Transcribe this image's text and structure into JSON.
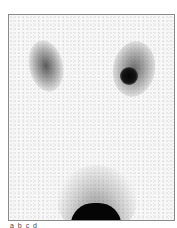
{
  "image": {
    "description": "Grayscale nuclear medicine renal scintigraphy scan, posterior view",
    "background": "#f7f7f7",
    "frame_border": "#8a8a8a",
    "structures": [
      {
        "name": "left-kidney",
        "intensity": "moderate"
      },
      {
        "name": "right-kidney",
        "intensity": "moderate with focal hot spot"
      },
      {
        "name": "bladder",
        "intensity": "high"
      }
    ]
  },
  "caption": {
    "text": "a b c d"
  }
}
